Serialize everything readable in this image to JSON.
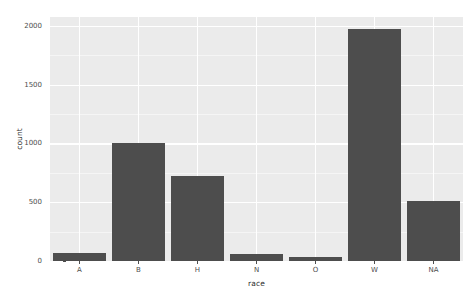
{
  "chart_data": {
    "type": "bar",
    "title": "",
    "subtitle": "",
    "xlabel": "race",
    "ylabel": "count",
    "categories": [
      "A",
      "B",
      "H",
      "N",
      "O",
      "W",
      "NA"
    ],
    "values": [
      65,
      1000,
      725,
      60,
      30,
      1970,
      510
    ],
    "ylim": [
      0,
      2075
    ],
    "xlim_note": "categorical, 7 discrete positions",
    "y_ticks": [
      0,
      500,
      1000,
      1500,
      2000
    ],
    "y_tick_labels": [
      "0",
      "500",
      "1000",
      "1500",
      "2000"
    ],
    "y_minor_ticks": [
      250,
      750,
      1250,
      1750
    ],
    "legend": null,
    "legend_position": "none",
    "grid": {
      "major_y": true,
      "minor_y": true,
      "major_x": true,
      "minor_x": false
    },
    "series": [
      {
        "name": "count",
        "values": [
          65,
          1000,
          725,
          60,
          30,
          1970,
          510
        ]
      }
    ],
    "annotations": []
  },
  "style": {
    "panel_background": "#ebebeb",
    "page_background": "#ffffff",
    "bar_fill": "#4d4d4d",
    "gridline_major": "#ffffff",
    "gridline_minor": "#f5f5f5",
    "axis_text_color": "#4d4d4d",
    "axis_title_color": "#2b2b2b"
  }
}
